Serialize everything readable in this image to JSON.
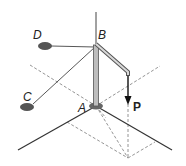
{
  "diagram": {
    "type": "3d-statics-pole",
    "labels": {
      "A": "A",
      "B": "B",
      "C": "C",
      "D": "D",
      "P": "P"
    },
    "colors": {
      "line": "#333333",
      "dashed": "#777777",
      "anchor": "#555555",
      "pole_fill": "#bdbdbd",
      "pole_edge": "#555555"
    }
  }
}
